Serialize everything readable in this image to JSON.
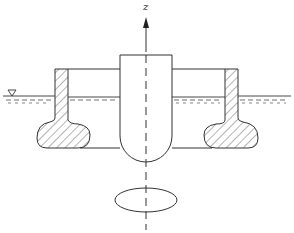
{
  "diagram": {
    "title": "",
    "axis_label": "z",
    "water_level_symbol": "▽",
    "elements": [
      {
        "name": "central-column",
        "shape": "cylinder with hemispherical bottom"
      },
      {
        "name": "left-pontoon",
        "shape": "hatched column with bulbous foot"
      },
      {
        "name": "right-pontoon",
        "shape": "hatched column with bulbous foot"
      },
      {
        "name": "deck",
        "shape": "horizontal connecting line"
      },
      {
        "name": "water-surface",
        "shape": "horizontal line with dashed ripples"
      },
      {
        "name": "waterplane-ellipse",
        "shape": "ellipse below structure"
      },
      {
        "name": "z-axis",
        "shape": "vertical dashed centerline with arrow"
      }
    ],
    "colors": {
      "stroke": "#333333",
      "background": "#ffffff"
    }
  }
}
